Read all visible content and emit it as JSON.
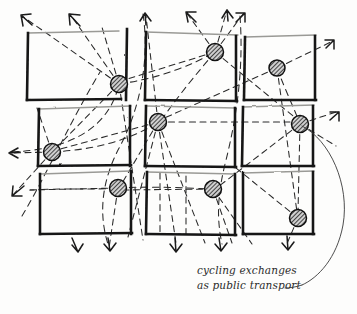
{
  "drawing": {
    "title": "cycling exchanges as public transport",
    "medium": "hand-drawn ink sketch",
    "ink_color": "#1a1a1a",
    "paper_color": "#fdfdfc",
    "node_fill": "#d8d8d8",
    "node_hatch_color": "#1a1a1a"
  },
  "caption": {
    "line1": "cycling exchanges",
    "line2": "as public transport",
    "leader_from_node": "node-right-middle",
    "leader_style": "thin curved line"
  },
  "grid": {
    "rows": 3,
    "cols": 3,
    "description": "3 by 3 arrangement of hand-drawn city blocks",
    "blocks": [
      {
        "id": "block-r1c1",
        "label": "top-left block",
        "x": 27,
        "y": 33,
        "w": 93,
        "h": 68
      },
      {
        "id": "block-r1c2",
        "label": "top-middle block",
        "x": 146,
        "y": 33,
        "w": 93,
        "h": 68
      },
      {
        "id": "block-r1c3",
        "label": "top-right block",
        "x": 244,
        "y": 36,
        "w": 72,
        "h": 64
      },
      {
        "id": "block-r2c1",
        "label": "middle-left block",
        "x": 39,
        "y": 108,
        "w": 93,
        "h": 58
      },
      {
        "id": "block-r2c2",
        "label": "center block",
        "x": 146,
        "y": 106,
        "w": 90,
        "h": 60
      },
      {
        "id": "block-r2c3",
        "label": "middle-right block",
        "x": 242,
        "y": 106,
        "w": 72,
        "h": 60
      },
      {
        "id": "block-r3c1",
        "label": "bottom-left block",
        "x": 39,
        "y": 173,
        "w": 93,
        "h": 62
      },
      {
        "id": "block-r3c2",
        "label": "bottom-middle block",
        "x": 146,
        "y": 173,
        "w": 90,
        "h": 62
      },
      {
        "id": "block-r3c3",
        "label": "bottom-right block",
        "x": 242,
        "y": 173,
        "w": 72,
        "h": 62
      }
    ]
  },
  "nodes": [
    {
      "id": "node-top-left",
      "label": "cycling exchange node 1",
      "cx": 119,
      "cy": 84,
      "r": 8.5
    },
    {
      "id": "node-top-middle",
      "label": "cycling exchange node 2",
      "cx": 215,
      "cy": 52,
      "r": 8.5
    },
    {
      "id": "node-top-right",
      "label": "cycling exchange node 3",
      "cx": 277,
      "cy": 68,
      "r": 8.0
    },
    {
      "id": "node-left-middle",
      "label": "cycling exchange node 4",
      "cx": 52,
      "cy": 152,
      "r": 8.5
    },
    {
      "id": "node-center",
      "label": "cycling exchange node 5",
      "cx": 158,
      "cy": 122,
      "r": 8.5
    },
    {
      "id": "node-right-middle",
      "label": "cycling exchange node 6",
      "cx": 300,
      "cy": 124,
      "r": 8.5
    },
    {
      "id": "node-bottom-left",
      "label": "cycling exchange node 7",
      "cx": 118,
      "cy": 188,
      "r": 8.5
    },
    {
      "id": "node-bottom-middle",
      "label": "cycling exchange node 8",
      "cx": 213,
      "cy": 189,
      "r": 8.5
    },
    {
      "id": "node-bottom-right",
      "label": "cycling exchange node 9",
      "cx": 298,
      "cy": 218,
      "r": 8.5
    }
  ],
  "arrows": {
    "count": 14,
    "description": "dashed route arrows radiating outward beyond the block grid",
    "directions": [
      "up-left",
      "up",
      "up-right",
      "left",
      "right",
      "down",
      "down-left"
    ]
  }
}
